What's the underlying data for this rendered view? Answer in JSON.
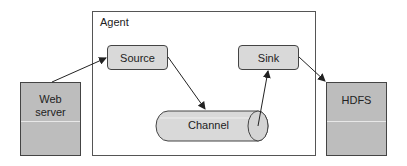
{
  "diagram": {
    "agent": {
      "label": "Agent"
    },
    "source": {
      "label": "Source"
    },
    "sink": {
      "label": "Sink"
    },
    "channel": {
      "label": "Channel"
    },
    "web_server": {
      "label_line1": "Web",
      "label_line2": "server"
    },
    "hdfs": {
      "label": "HDFS"
    },
    "edges": [
      {
        "from": "Web server",
        "to": "Source"
      },
      {
        "from": "Source",
        "to": "Channel"
      },
      {
        "from": "Channel",
        "to": "Sink"
      },
      {
        "from": "Sink",
        "to": "HDFS"
      }
    ]
  }
}
